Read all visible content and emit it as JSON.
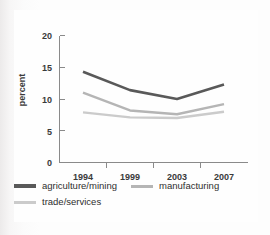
{
  "chart_data": {
    "type": "line",
    "title": "",
    "xlabel": "",
    "ylabel": "percent",
    "categories": [
      "1994",
      "1999",
      "2003",
      "2007"
    ],
    "ylim": [
      0,
      20
    ],
    "yticks": [
      0,
      5,
      10,
      15,
      20
    ],
    "ytick_labels": [
      "0",
      "5",
      "10",
      "15",
      "20"
    ],
    "grid": false,
    "legend_position": "bottom-left",
    "series": [
      {
        "name": "agriculture/mining",
        "color": "#595959",
        "values": [
          14.3,
          11.4,
          10.0,
          12.3
        ]
      },
      {
        "name": "manufacturing",
        "color": "#b5b5b5",
        "values": [
          11.0,
          8.2,
          7.6,
          9.2
        ]
      },
      {
        "name": "trade/services",
        "color": "#cbcbcb",
        "values": [
          7.9,
          7.1,
          7.0,
          8.0
        ]
      }
    ]
  },
  "axes": {
    "y_title": "percent",
    "y_labels": [
      "20",
      "15",
      "10",
      "5",
      "0"
    ],
    "x_labels": [
      "1994",
      "1999",
      "2003",
      "2007"
    ]
  },
  "legend": {
    "items": [
      {
        "label": "agriculture/mining",
        "color": "#595959"
      },
      {
        "label": "manufacturing",
        "color": "#b5b5b5"
      },
      {
        "label": "trade/services",
        "color": "#cbcbcb"
      }
    ]
  }
}
